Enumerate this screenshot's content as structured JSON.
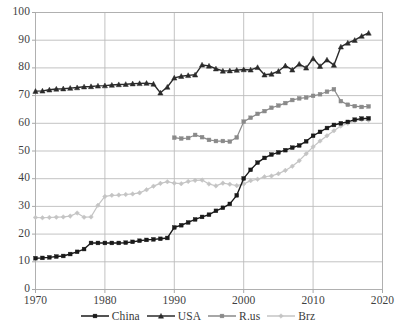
{
  "chart_data": {
    "type": "line",
    "title": "",
    "xlabel": "",
    "ylabel": "",
    "xlim": [
      1970,
      2020
    ],
    "ylim": [
      0,
      100
    ],
    "xticks": [
      "1970",
      "1980",
      "1990",
      "2000",
      "2010",
      "2020"
    ],
    "yticks": [
      "0",
      "10",
      "20",
      "30",
      "40",
      "50",
      "60",
      "70",
      "80",
      "90",
      "100"
    ],
    "grid": true,
    "legend_position": "bottom",
    "x": [
      1970,
      1971,
      1972,
      1973,
      1974,
      1975,
      1976,
      1977,
      1978,
      1979,
      1980,
      1981,
      1982,
      1983,
      1984,
      1985,
      1986,
      1987,
      1988,
      1989,
      1990,
      1991,
      1992,
      1993,
      1994,
      1995,
      1996,
      1997,
      1998,
      1999,
      2000,
      2001,
      2002,
      2003,
      2004,
      2005,
      2006,
      2007,
      2008,
      2009,
      2010,
      2011,
      2012,
      2013,
      2014,
      2015,
      2016,
      2017,
      2018
    ],
    "series": [
      {
        "name": "China",
        "color": "#1a1a1a",
        "marker": "square",
        "values": [
          11.3,
          11.4,
          11.6,
          11.9,
          12.1,
          12.8,
          13.6,
          14.6,
          16.8,
          16.8,
          16.8,
          16.8,
          16.8,
          16.9,
          17.2,
          17.6,
          17.9,
          18.1,
          18.3,
          18.6,
          22.4,
          23.2,
          24.2,
          25.3,
          26.2,
          27.0,
          28.4,
          29.5,
          30.9,
          34.0,
          40.1,
          43.2,
          45.8,
          47.5,
          48.7,
          49.5,
          50.3,
          51.2,
          52.0,
          53.5,
          55.5,
          56.9,
          58.3,
          59.4,
          60.0,
          60.5,
          61.3,
          61.7,
          61.8
        ]
      },
      {
        "name": "USA",
        "color": "#2b2b2b",
        "marker": "triangle",
        "values": [
          71.6,
          71.7,
          72.1,
          72.4,
          72.5,
          72.7,
          72.9,
          73.2,
          73.3,
          73.5,
          73.6,
          73.8,
          74.0,
          74.1,
          74.3,
          74.4,
          74.5,
          74.2,
          71.0,
          73.1,
          76.4,
          77.0,
          77.3,
          77.5,
          81.1,
          80.7,
          79.7,
          78.9,
          79.0,
          79.2,
          79.4,
          79.3,
          80.2,
          77.5,
          77.8,
          78.8,
          80.8,
          79.3,
          81.4,
          80.0,
          83.4,
          80.6,
          82.9,
          81.0,
          87.6,
          89.0,
          90.0,
          91.5,
          92.6
        ]
      },
      {
        "name": "R.us",
        "color": "#8a8a8a",
        "marker": "square",
        "values": [
          null,
          null,
          null,
          null,
          null,
          null,
          null,
          null,
          null,
          null,
          null,
          null,
          null,
          null,
          null,
          null,
          null,
          null,
          null,
          null,
          54.8,
          54.5,
          54.7,
          55.8,
          55.0,
          54.0,
          53.6,
          53.6,
          53.4,
          54.9,
          60.6,
          62.0,
          63.4,
          64.4,
          65.6,
          66.4,
          67.3,
          68.4,
          69.0,
          69.3,
          69.9,
          70.5,
          71.4,
          72.3,
          68.0,
          66.7,
          66.2,
          65.9,
          66.1
        ]
      },
      {
        "name": "Brz",
        "color": "#c4c4c4",
        "marker": "diamond",
        "values": [
          26.0,
          25.9,
          26.0,
          26.1,
          26.2,
          26.5,
          27.6,
          26.1,
          26.2,
          30.4,
          33.6,
          34.0,
          34.1,
          34.3,
          34.5,
          34.9,
          36.0,
          37.3,
          38.3,
          38.9,
          38.4,
          38.2,
          39.0,
          39.4,
          39.5,
          38.1,
          37.4,
          38.4,
          38.0,
          37.5,
          38.1,
          39.3,
          39.8,
          40.7,
          41.0,
          41.8,
          43.0,
          44.5,
          46.5,
          49.0,
          51.5,
          53.6,
          55.5,
          57.3,
          59.0,
          60.0,
          60.8,
          61.3,
          61.1
        ]
      }
    ]
  },
  "legend": {
    "items": [
      {
        "label": "China"
      },
      {
        "label": "USA"
      },
      {
        "label": "R.us"
      },
      {
        "label": "Brz"
      }
    ]
  },
  "axes": {
    "y_labels": [
      "100",
      "90",
      "80",
      "70",
      "60",
      "50",
      "40",
      "30",
      "20",
      "10",
      "0"
    ],
    "x_labels": [
      "1970",
      "1980",
      "1990",
      "2000",
      "2010",
      "2020"
    ]
  }
}
